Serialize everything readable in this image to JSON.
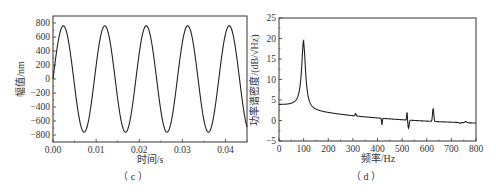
{
  "chart_data": [
    {
      "type": "line",
      "panel": "(c)",
      "title": "",
      "xlabel": "时间/s",
      "ylabel": "幅值/nm",
      "xlim": [
        0.0,
        0.045
      ],
      "ylim": [
        -900,
        900
      ],
      "xticks": [
        "0.00",
        "0.01",
        "0.02",
        "0.03",
        "0.04"
      ],
      "yticks": [
        "800",
        "600",
        "400",
        "200",
        "0",
        "-200",
        "-400",
        "-600",
        "-800"
      ],
      "grid": false,
      "legend": null,
      "series": [
        {
          "name": "displacement",
          "description": "sinusoid, amplitude ~760 nm, frequency ~104 Hz (period ~0.0096 s), starting near 0 and rising",
          "amplitude": 760,
          "frequency_hz": 104,
          "x": [
            0.0,
            0.0024,
            0.0072,
            0.012,
            0.0168,
            0.0216,
            0.0264,
            0.0312,
            0.036,
            0.0408,
            0.045
          ],
          "values": [
            0,
            760,
            -760,
            760,
            -760,
            760,
            -760,
            760,
            -760,
            760,
            -500
          ]
        }
      ]
    },
    {
      "type": "line",
      "panel": "(d)",
      "title": "",
      "xlabel": "频率/Hz",
      "ylabel": "功率谱密度/(dB/√Hz)",
      "xlim": [
        0,
        800
      ],
      "ylim": [
        -5,
        25
      ],
      "xticks": [
        "0",
        "100",
        "200",
        "300",
        "400",
        "500",
        "600",
        "700",
        "800"
      ],
      "yticks": [
        "25",
        "20",
        "15",
        "10",
        "5",
        "0",
        "-5"
      ],
      "grid": false,
      "legend": null,
      "series": [
        {
          "name": "PSD",
          "x": [
            0,
            25,
            50,
            75,
            90,
            100,
            110,
            125,
            150,
            200,
            250,
            300,
            310,
            320,
            400,
            415,
            420,
            500,
            515,
            520,
            525,
            540,
            600,
            615,
            625,
            635,
            650,
            700,
            730,
            760,
            780,
            800
          ],
          "values": [
            3.8,
            4.3,
            5.3,
            7.5,
            11,
            19.5,
            11,
            7.5,
            5.3,
            3.5,
            2.7,
            2.1,
            2.4,
            1.7,
            1.1,
            1.0,
            -0.8,
            0.5,
            0.6,
            2.6,
            -1.8,
            -0.5,
            -0.7,
            -0.5,
            2.9,
            -0.3,
            -0.8,
            -1.1,
            -1.3,
            -1.1,
            -1.6,
            -1.6
          ]
        }
      ]
    }
  ],
  "captions": {
    "c": "（ c ）",
    "d": "（ d ）"
  },
  "panel_c": {
    "xlabel": "时间/s",
    "ylabel": "幅值/nm",
    "xticks": [
      "0.00",
      "0.01",
      "0.02",
      "0.03",
      "0.04"
    ],
    "yticks": [
      "800",
      "600",
      "400",
      "200",
      "0",
      "−200",
      "−400",
      "−600",
      "−800"
    ]
  },
  "panel_d": {
    "xlabel": "频率/Hz",
    "ylabel": "功率谱密度/(dB/√Hz)",
    "xticks": [
      "0",
      "100",
      "200",
      "300",
      "400",
      "500",
      "600",
      "700",
      "800"
    ],
    "yticks": [
      "25",
      "20",
      "15",
      "10",
      "5",
      "0",
      "−5"
    ]
  }
}
